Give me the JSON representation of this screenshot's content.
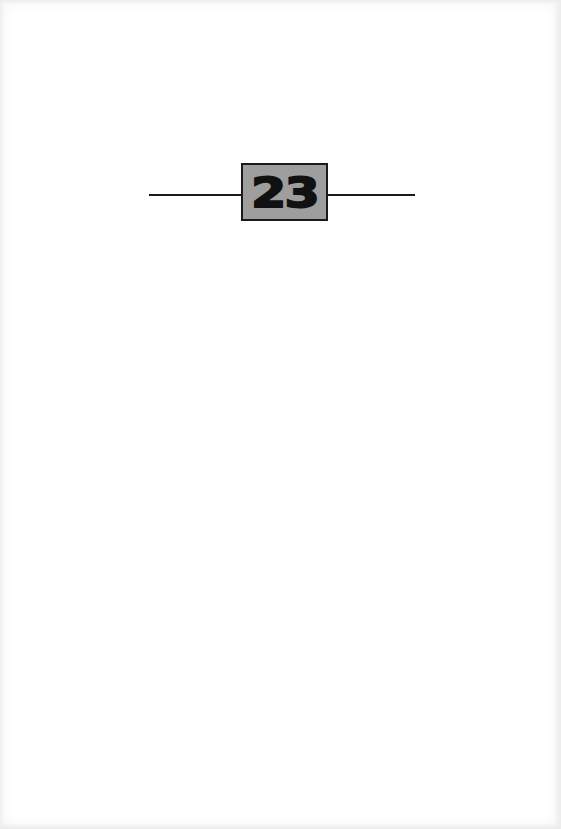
{
  "page": {
    "chapter_number": "23"
  },
  "colors": {
    "background": "#ffffff",
    "box_fill": "#9e9e9e",
    "ink": "#111111"
  }
}
